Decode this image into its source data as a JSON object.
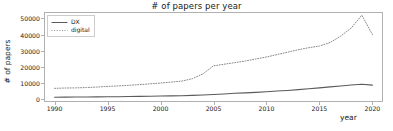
{
  "chart_data": {
    "type": "line",
    "title": "# of papers per year",
    "xlabel": "year",
    "ylabel": "# of papers",
    "xlim": [
      1989,
      2021
    ],
    "ylim": [
      -2000,
      54000
    ],
    "grid": false,
    "legend_position": "upper left",
    "xticks": [
      1990,
      1995,
      2000,
      2005,
      2010,
      2015,
      2020
    ],
    "xtick_labels": [
      "1990",
      "1995",
      "2000",
      "2005",
      "2010",
      "2015",
      "2020"
    ],
    "yticks": [
      0,
      10000,
      20000,
      30000,
      40000,
      50000
    ],
    "ytick_labels": [
      "0",
      "10000",
      "20000",
      "30000",
      "40000",
      "50000"
    ],
    "x": [
      1990,
      1991,
      1992,
      1993,
      1994,
      1995,
      1996,
      1997,
      1998,
      1999,
      2000,
      2001,
      2002,
      2003,
      2004,
      2005,
      2006,
      2007,
      2008,
      2009,
      2010,
      2011,
      2012,
      2013,
      2014,
      2015,
      2016,
      2017,
      2018,
      2019,
      2020
    ],
    "series": [
      {
        "name": "DX",
        "style": "solid",
        "color": "#5a5a5a",
        "values": [
          1000,
          1050,
          1100,
          1150,
          1200,
          1250,
          1300,
          1400,
          1500,
          1600,
          1700,
          1800,
          1900,
          2100,
          2400,
          2700,
          3000,
          3400,
          3700,
          4000,
          4400,
          4800,
          5200,
          5700,
          6200,
          6800,
          7400,
          8000,
          8600,
          9000,
          8500
        ]
      },
      {
        "name": "digital",
        "style": "dotted",
        "color": "#8a8a8a",
        "values": [
          6500,
          6700,
          6800,
          7000,
          7300,
          7700,
          8000,
          8400,
          8800,
          9300,
          9800,
          10400,
          11000,
          12500,
          15500,
          20500,
          21500,
          22500,
          23500,
          24800,
          26000,
          27500,
          29000,
          30500,
          31800,
          32800,
          35000,
          39000,
          44000,
          52000,
          40000
        ]
      }
    ]
  }
}
